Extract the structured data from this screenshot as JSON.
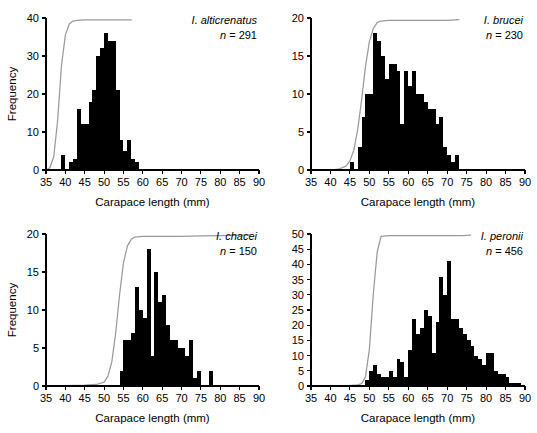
{
  "figure": {
    "title": "",
    "panel_count": 4
  },
  "axes": {
    "xlabel": "Carapace length (mm)",
    "ylabel": "Frequency",
    "xlim": [
      35,
      90
    ],
    "xticks": [
      35,
      40,
      45,
      50,
      55,
      60,
      65,
      70,
      75,
      80,
      85,
      90
    ],
    "bin_width": 1
  },
  "colors": {
    "bar": "#000000",
    "curve": "#9a9a9a",
    "axis": "#000000",
    "background": "#ffffff"
  },
  "chart_data": [
    {
      "type": "bar",
      "panel_id": "p0",
      "title": "I. alticrenatus",
      "species": "I. alticrenatus",
      "n_label": "n = 291",
      "n": 291,
      "xlabel": "Carapace length (mm)",
      "ylabel": "Frequency",
      "xlim": [
        35,
        90
      ],
      "ylim": [
        0,
        40
      ],
      "xticks": [
        35,
        40,
        45,
        50,
        55,
        60,
        65,
        70,
        75,
        80,
        85,
        90
      ],
      "yticks": [
        0,
        10,
        20,
        30,
        40
      ],
      "grid": false,
      "legend": "none",
      "bin_width": 1,
      "bins": [
        39,
        40,
        41,
        42,
        43,
        44,
        45,
        46,
        47,
        48,
        49,
        50,
        51,
        52,
        53,
        54,
        55,
        56,
        57,
        58
      ],
      "values": [
        4,
        0,
        2,
        3,
        16,
        12,
        12,
        18,
        21,
        30,
        32,
        36,
        34,
        34,
        21,
        8,
        5,
        8,
        3,
        2
      ],
      "cumulative_curve": {
        "name": "cumulative frequency",
        "x": [
          35,
          36,
          37,
          38,
          39,
          40,
          41,
          42,
          43,
          45,
          50,
          55,
          57
        ],
        "y": [
          0,
          0.6,
          3.5,
          13,
          27.5,
          35.5,
          38.4,
          39.2,
          39.4,
          39.5,
          39.5,
          39.5,
          39.5
        ]
      }
    },
    {
      "type": "bar",
      "panel_id": "p1",
      "title": "I. brucei",
      "species": "I. brucei",
      "n_label": "n = 230",
      "n": 230,
      "xlabel": "Carapace length (mm)",
      "ylabel": "Frequency",
      "xlim": [
        35,
        90
      ],
      "ylim": [
        0,
        20
      ],
      "xticks": [
        35,
        40,
        45,
        50,
        55,
        60,
        65,
        70,
        75,
        80,
        85,
        90
      ],
      "yticks": [
        0,
        5,
        10,
        15,
        20
      ],
      "grid": false,
      "legend": "none",
      "bin_width": 1,
      "bins": [
        45,
        46,
        47,
        48,
        49,
        50,
        51,
        52,
        53,
        54,
        55,
        56,
        57,
        58,
        59,
        60,
        61,
        62,
        63,
        64,
        65,
        66,
        67,
        68,
        69,
        70,
        71,
        72
      ],
      "values": [
        1,
        0,
        3,
        7,
        10,
        10,
        18,
        17,
        15,
        12,
        14,
        14,
        13,
        6,
        13,
        11,
        13,
        10,
        10,
        9,
        8,
        8,
        6,
        7,
        3,
        2,
        1,
        2
      ],
      "cumulative_curve": {
        "name": "cumulative frequency",
        "x": [
          40,
          42,
          44,
          45,
          46,
          47,
          48,
          49,
          50,
          51,
          52,
          53,
          55,
          60,
          65,
          70,
          73
        ],
        "y": [
          0,
          0.1,
          0.5,
          1.2,
          2.6,
          5.3,
          9.2,
          13.6,
          16.9,
          18.6,
          19.4,
          19.6,
          19.7,
          19.7,
          19.7,
          19.7,
          19.8
        ]
      }
    },
    {
      "type": "bar",
      "panel_id": "p2",
      "title": "I. chacei",
      "species": "I. chacei",
      "n_label": "n = 150",
      "n": 150,
      "xlabel": "Carapace length (mm)",
      "ylabel": "Frequency",
      "xlim": [
        35,
        90
      ],
      "ylim": [
        0,
        20
      ],
      "xticks": [
        35,
        40,
        45,
        50,
        55,
        60,
        65,
        70,
        75,
        80,
        85,
        90
      ],
      "yticks": [
        0,
        5,
        10,
        15,
        20
      ],
      "grid": false,
      "legend": "none",
      "bin_width": 1,
      "bins": [
        54,
        55,
        56,
        57,
        58,
        59,
        60,
        61,
        62,
        63,
        64,
        65,
        66,
        67,
        68,
        69,
        70,
        71,
        72,
        73,
        74,
        77
      ],
      "values": [
        2,
        6,
        6,
        7,
        13,
        10,
        9,
        18,
        4,
        15,
        11,
        12,
        8,
        6,
        6,
        5,
        5,
        4,
        6,
        1,
        2,
        2
      ],
      "cumulative_curve": {
        "name": "cumulative frequency",
        "x": [
          35,
          45,
          48,
          50,
          51,
          52,
          53,
          54,
          55,
          56,
          57,
          58,
          60,
          65,
          70,
          75,
          80,
          85,
          88
        ],
        "y": [
          0,
          0.1,
          0.2,
          0.5,
          1.3,
          3.2,
          7.0,
          12.0,
          16.2,
          18.4,
          19.3,
          19.6,
          19.7,
          19.7,
          19.7,
          19.75,
          19.8,
          19.85,
          19.9
        ]
      }
    },
    {
      "type": "bar",
      "panel_id": "p3",
      "title": "I. peronii",
      "species": "I. peronii",
      "n_label": "n = 456",
      "n": 456,
      "xlabel": "Carapace length (mm)",
      "ylabel": "Frequency",
      "xlim": [
        35,
        90
      ],
      "ylim": [
        0,
        50
      ],
      "xticks": [
        35,
        40,
        45,
        50,
        55,
        60,
        65,
        70,
        75,
        80,
        85,
        90
      ],
      "yticks": [
        0,
        5,
        10,
        15,
        20,
        25,
        30,
        35,
        40,
        45,
        50
      ],
      "grid": false,
      "legend": "none",
      "bin_width": 1,
      "bins": [
        49,
        50,
        51,
        52,
        53,
        54,
        55,
        56,
        57,
        58,
        59,
        60,
        61,
        62,
        63,
        64,
        65,
        66,
        67,
        68,
        69,
        70,
        71,
        72,
        73,
        74,
        75,
        76,
        77,
        78,
        79,
        80,
        81,
        82,
        83,
        84,
        85,
        86,
        87,
        88,
        89
      ],
      "values": [
        2,
        5,
        7,
        4,
        3,
        3,
        5,
        3,
        9,
        8,
        3,
        12,
        22,
        17,
        19,
        25,
        23,
        11,
        21,
        36,
        30,
        41,
        22,
        22,
        19,
        17,
        15,
        13,
        10,
        9,
        7,
        11,
        11,
        5,
        4,
        4,
        3,
        1,
        1,
        1,
        0
      ],
      "cumulative_curve": {
        "name": "cumulative frequency",
        "x": [
          35,
          45,
          47,
          48,
          49,
          50,
          51,
          52,
          53,
          55,
          60,
          65,
          70,
          74,
          76
        ],
        "y": [
          0,
          0.2,
          0.4,
          0.8,
          3.0,
          12.0,
          30.0,
          44.0,
          49.2,
          49.5,
          49.5,
          49.5,
          49.5,
          49.5,
          49.6
        ]
      }
    }
  ]
}
